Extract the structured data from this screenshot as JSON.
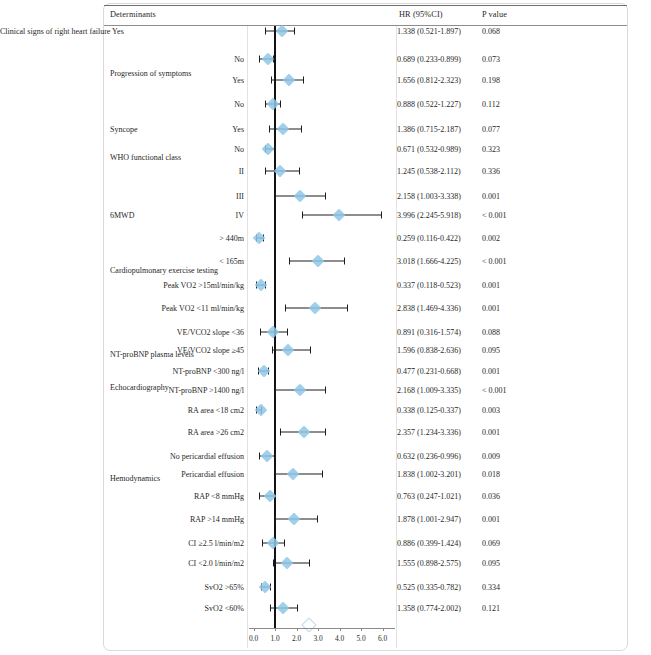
{
  "figure": {
    "type": "forest-plot",
    "columns": {
      "determinants": "Determinants",
      "hr_ci": "HR  (95%CI)",
      "p_value": "P value"
    },
    "axis": {
      "label": "",
      "min": 0.0,
      "max": 6.0,
      "ticks": [
        "0.0",
        "1.0",
        "2.0",
        "3.0",
        "4.0",
        "5.0",
        "6.0"
      ],
      "tick_values": [
        0.0,
        1.0,
        2.0,
        3.0,
        4.0,
        5.0,
        6.0
      ],
      "reference_line": 1.0
    },
    "marker_color": "#8fc7e8",
    "line_color": "#1c1c1c"
  },
  "chart_data": {
    "type": "forest",
    "title": "",
    "xlabel": "",
    "ylabel": "",
    "xlim": [
      0.0,
      6.0
    ],
    "reference_line": 1.0,
    "grid": false,
    "legend": "none",
    "columns": [
      "Determinants",
      "HR  (95%CI)",
      "P value"
    ],
    "groups": [
      {
        "name": "",
        "y": 31
      },
      {
        "name": "Progression of symptoms",
        "y": 73
      },
      {
        "name": "Syncope",
        "y": 129
      },
      {
        "name": "WHO functional class",
        "y": 157
      },
      {
        "name": "6MWD",
        "y": 215
      },
      {
        "name": "Cardiopulmonary exercise testing",
        "y": 270
      },
      {
        "name": "NT-proBNP plasma levels",
        "y": 354
      },
      {
        "name": "Echocardiography",
        "y": 387
      },
      {
        "name": "Hemodynamics",
        "y": 478
      }
    ],
    "rows": [
      {
        "label": "Clinical signs of right heart failure  Yes",
        "label_align": "left",
        "label_x": 110,
        "y": 31,
        "hr": 1.338,
        "lo": 0.521,
        "hi": 1.897,
        "hr_text": "1.338  (0.521-1.897)",
        "p_text": "0.068",
        "marker": "solid"
      },
      {
        "label": "No",
        "label_align": "right",
        "label_x": 244,
        "y": 59,
        "hr": 0.689,
        "lo": 0.233,
        "hi": 0.899,
        "hr_text": "0.689  (0.233-0.899)",
        "p_text": "0.073",
        "marker": "solid"
      },
      {
        "label": "Yes",
        "label_align": "right",
        "label_x": 244,
        "y": 80,
        "hr": 1.656,
        "lo": 0.812,
        "hi": 2.323,
        "hr_text": "1.656  (0.812-2.323)",
        "p_text": "0.198",
        "marker": "solid"
      },
      {
        "label": "No",
        "label_align": "right",
        "label_x": 244,
        "y": 104,
        "hr": 0.888,
        "lo": 0.522,
        "hi": 1.227,
        "hr_text": "0.888  (0.522-1.227)",
        "p_text": "0.112",
        "marker": "solid"
      },
      {
        "label": "Yes",
        "label_align": "right",
        "label_x": 244,
        "y": 129,
        "hr": 1.386,
        "lo": 0.715,
        "hi": 2.187,
        "hr_text": "1.386  (0.715-2.187)",
        "p_text": "0.077",
        "marker": "solid"
      },
      {
        "label": "No",
        "label_align": "right",
        "label_x": 244,
        "y": 149,
        "hr": 0.671,
        "lo": 0.532,
        "hi": 0.989,
        "hr_text": "0.671  (0.532-0.989)",
        "p_text": "0.323",
        "marker": "solid"
      },
      {
        "label": "II",
        "label_align": "right",
        "label_x": 244,
        "y": 171,
        "hr": 1.245,
        "lo": 0.538,
        "hi": 2.112,
        "hr_text": "1.245  (0.538-2.112)",
        "p_text": "0.336",
        "marker": "solid"
      },
      {
        "label": "III",
        "label_align": "right",
        "label_x": 244,
        "y": 196,
        "hr": 2.158,
        "lo": 1.003,
        "hi": 3.338,
        "hr_text": "2.158  (1.003-3.338)",
        "p_text": "0.001",
        "marker": "solid"
      },
      {
        "label": "IV",
        "label_align": "right",
        "label_x": 244,
        "y": 215,
        "hr": 3.996,
        "lo": 2.245,
        "hi": 5.918,
        "hr_text": "3.996  (2.245-5.918)",
        "p_text": "< 0.001",
        "marker": "solid"
      },
      {
        "label": "> 440m",
        "label_align": "right",
        "label_x": 244,
        "y": 238,
        "hr": 0.259,
        "lo": 0.116,
        "hi": 0.422,
        "hr_text": "0.259  (0.116-0.422)",
        "p_text": "0.002",
        "marker": "solid"
      },
      {
        "label": "< 165m",
        "label_align": "right",
        "label_x": 244,
        "y": 261,
        "hr": 3.018,
        "lo": 1.666,
        "hi": 4.225,
        "hr_text": "3.018  (1.666-4.225)",
        "p_text": "< 0.001",
        "marker": "solid"
      },
      {
        "label": "Peak VO2 >15ml/min/kg",
        "label_align": "right",
        "label_x": 244,
        "y": 285,
        "hr": 0.337,
        "lo": 0.118,
        "hi": 0.523,
        "hr_text": "0.337  (0.118-0.523)",
        "p_text": "0.001",
        "marker": "solid"
      },
      {
        "label": "Peak VO2 <11 ml/min/kg",
        "label_align": "right",
        "label_x": 244,
        "y": 308,
        "hr": 2.838,
        "lo": 1.469,
        "hi": 4.336,
        "hr_text": "2.838  (1.469-4.336)",
        "p_text": "0.001",
        "marker": "solid"
      },
      {
        "label": "VE/VCO2 slope <36",
        "label_align": "right",
        "label_x": 244,
        "y": 332,
        "hr": 0.891,
        "lo": 0.316,
        "hi": 1.574,
        "hr_text": "0.891  (0.316-1.574)",
        "p_text": "0.088",
        "marker": "solid"
      },
      {
        "label": "VE/VCO2 slope ≥45",
        "label_align": "right",
        "label_x": 244,
        "y": 350,
        "hr": 1.596,
        "lo": 0.838,
        "hi": 2.636,
        "hr_text": "1.596  (0.838-2.636)",
        "p_text": "0.095",
        "marker": "solid"
      },
      {
        "label": "NT-proBNP <300 ng/l",
        "label_align": "right",
        "label_x": 244,
        "y": 371,
        "hr": 0.477,
        "lo": 0.231,
        "hi": 0.668,
        "hr_text": "0.477  (0.231-0.668)",
        "p_text": "0.001",
        "marker": "solid"
      },
      {
        "label": "NT-proBNP >1400 ng/l",
        "label_align": "right",
        "label_x": 244,
        "y": 390,
        "hr": 2.168,
        "lo": 1.009,
        "hi": 3.335,
        "hr_text": "2.168  (1.009-3.335)",
        "p_text": "< 0.001",
        "marker": "solid"
      },
      {
        "label": "RA area <18 cm2",
        "label_align": "right",
        "label_x": 244,
        "y": 410,
        "hr": 0.338,
        "lo": 0.125,
        "hi": 0.337,
        "hr_text": "0.338  (0.125-0.337)",
        "p_text": "0.003",
        "marker": "solid"
      },
      {
        "label": "RA area >26 cm2",
        "label_align": "right",
        "label_x": 244,
        "y": 432,
        "hr": 2.357,
        "lo": 1.234,
        "hi": 3.336,
        "hr_text": "2.357  (1.234-3.336)",
        "p_text": "0.001",
        "marker": "solid"
      },
      {
        "label": "No pericardial effusion",
        "label_align": "right",
        "label_x": 244,
        "y": 456,
        "hr": 0.632,
        "lo": 0.236,
        "hi": 0.996,
        "hr_text": "0.632  (0.236-0.996)",
        "p_text": "0.009",
        "marker": "solid"
      },
      {
        "label": "Pericardial effusion",
        "label_align": "right",
        "label_x": 244,
        "y": 474,
        "hr": 1.838,
        "lo": 1.002,
        "hi": 3.201,
        "hr_text": "1.838  (1.002-3.201)",
        "p_text": "0.018",
        "marker": "solid"
      },
      {
        "label": "RAP <8 mmHg",
        "label_align": "right",
        "label_x": 244,
        "y": 496,
        "hr": 0.763,
        "lo": 0.247,
        "hi": 1.021,
        "hr_text": "0.763  (0.247-1.021)",
        "p_text": "0.036",
        "marker": "solid"
      },
      {
        "label": "RAP >14 mmHg",
        "label_align": "right",
        "label_x": 244,
        "y": 519,
        "hr": 1.878,
        "lo": 1.001,
        "hi": 2.947,
        "hr_text": "1.878  (1.001-2.947)",
        "p_text": "0.001",
        "marker": "solid"
      },
      {
        "label": "CI ≥2.5 l/min/m2",
        "label_align": "right",
        "label_x": 244,
        "y": 543,
        "hr": 0.886,
        "lo": 0.399,
        "hi": 1.424,
        "hr_text": "0.886  (0.399-1.424)",
        "p_text": "0.069",
        "marker": "solid"
      },
      {
        "label": "CI <2.0 l/min/m2",
        "label_align": "right",
        "label_x": 244,
        "y": 563,
        "hr": 1.555,
        "lo": 0.898,
        "hi": 2.575,
        "hr_text": "1.555  (0.898-2.575)",
        "p_text": "0.095",
        "marker": "solid"
      },
      {
        "label": "SvO2 >65%",
        "label_align": "right",
        "label_x": 244,
        "y": 587,
        "hr": 0.525,
        "lo": 0.335,
        "hi": 0.782,
        "hr_text": "0.525  (0.335-0.782)",
        "p_text": "0.334",
        "marker": "solid"
      },
      {
        "label": "SvO2 <60%",
        "label_align": "right",
        "label_x": 244,
        "y": 608,
        "hr": 1.358,
        "lo": 0.774,
        "hi": 2.002,
        "hr_text": "1.358  (0.774-2.002)",
        "p_text": "0.121",
        "marker": "solid"
      },
      {
        "label": "",
        "label_align": "right",
        "label_x": 244,
        "y": 625,
        "hr": 2.6,
        "lo": null,
        "hi": null,
        "hr_text": "",
        "p_text": "",
        "marker": "hollow"
      }
    ]
  }
}
